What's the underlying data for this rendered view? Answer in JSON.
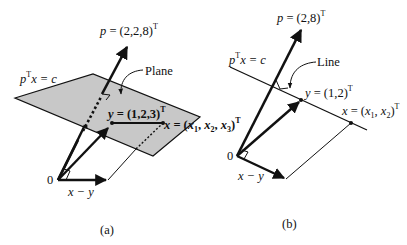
{
  "colors": {
    "ink": "#111111",
    "plane_fill": "#c8c8c8",
    "background": "#ffffff"
  },
  "panel_a": {
    "caption": "(a)",
    "p_label": "p = (2,2,8)",
    "p_sup": "T",
    "plane_eq_p": "p",
    "plane_eq_sup": "T",
    "plane_eq_rest": "x = c",
    "plane_callout": "Plane",
    "y_label": "y = (1,2,3)",
    "y_sup": "T",
    "x_label": "x = (x",
    "x_sub1": "1",
    "x_mid1": ", x",
    "x_sub2": "2",
    "x_mid2": ", x",
    "x_sub3": "3",
    "x_end": ")",
    "x_sup": "T",
    "origin": "0",
    "diff_label": "x − y"
  },
  "panel_b": {
    "caption": "(b)",
    "p_label": "p = (2,8)",
    "p_sup": "T",
    "line_eq_p": "p",
    "line_eq_sup": "T",
    "line_eq_rest": "x = c",
    "line_callout": "Line",
    "y_label": "y = (1,2)",
    "y_sup": "T",
    "x_label": "x = (x",
    "x_sub1": "1",
    "x_mid1": ", x",
    "x_sub2": "2",
    "x_end": ")",
    "x_sup": "T",
    "origin": "0",
    "diff_label": "x − y"
  }
}
